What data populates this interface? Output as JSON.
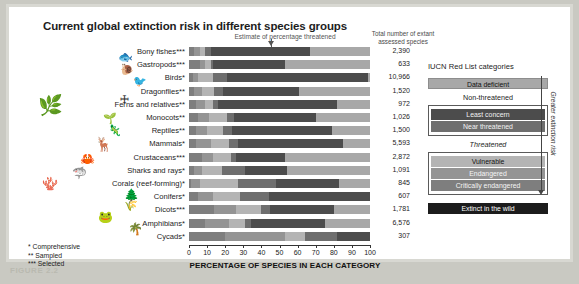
{
  "figure": {
    "caption": "FIGURE 2.2",
    "title": "Current global extinction risk in different species groups",
    "estimate_annotation": "Estimate of percentage threatened",
    "total_header_line1": "Total number of extant",
    "total_header_line2": "assessed species"
  },
  "axis": {
    "title": "PERCENTAGE OF SPECIES IN EACH CATEGORY",
    "ticks": [
      0,
      10,
      20,
      30,
      40,
      50,
      60,
      70,
      80,
      90,
      100
    ],
    "min": 0,
    "max": 100
  },
  "footnotes": [
    "* Comprehensive",
    "** Sampled",
    "*** Selected"
  ],
  "legend": {
    "title": "IUCN Red List categories",
    "data_deficient": "Data deficient",
    "non_threatened_header": "Non-threatened",
    "least_concern": "Least concern",
    "near_threatened": "Near threatened",
    "threatened_header": "Threatened",
    "vulnerable": "Vulnerable",
    "endangered": "Endangered",
    "critically_endangered": "Critically endangered",
    "extinct_in_the_wild": "Extinct in the wild",
    "risk_axis_label": "Greater extinction risk"
  },
  "colors": {
    "data_deficient": "#a8a8a8",
    "least_concern": "#4c4c4c",
    "near_threatened": "#6e6e6e",
    "vulnerable": "#b4b4b4",
    "endangered": "#949494",
    "critically_endangered": "#7e7e7e",
    "extinct_in_the_wild": "#1c1c1c",
    "frame": "#d8d8d2",
    "page": "#c9c9c2"
  },
  "chart_data": {
    "type": "bar",
    "orientation": "horizontal",
    "stacked": true,
    "title": "Current global extinction risk in different species groups",
    "xlabel": "PERCENTAGE OF SPECIES IN EACH CATEGORY",
    "ylabel": "",
    "xlim": [
      0,
      100
    ],
    "grid": true,
    "legend_position": "right",
    "series_order": [
      "critically_endangered",
      "endangered",
      "vulnerable",
      "near_threatened",
      "least_concern",
      "data_deficient",
      "extinct_in_the_wild"
    ],
    "categories": [
      "Bony fishes***",
      "Gastropods***",
      "Birds*",
      "Dragonflies**",
      "Ferns and relatives**",
      "Monocots**",
      "Reptiles**",
      "Mammals*",
      "Crustaceans***",
      "Sharks and rays*",
      "Corals (reef-forming)*",
      "Conifers*",
      "Dicots***",
      "Amphibians*",
      "Cycads*"
    ],
    "totals": [
      "2,390",
      "633",
      "10,966",
      "1,520",
      "972",
      "1,026",
      "1,500",
      "5,593",
      "2,872",
      "1,091",
      "845",
      "607",
      "1,781",
      "6,576",
      "307"
    ],
    "rows": [
      {
        "category": "Bony fishes***",
        "segments": [
          3,
          3,
          3,
          3,
          55,
          33,
          0
        ]
      },
      {
        "category": "Gastropods***",
        "segments": [
          6,
          3,
          3,
          1,
          40,
          47,
          0
        ]
      },
      {
        "category": "Birds*",
        "segments": [
          2,
          3,
          8,
          8,
          78,
          1,
          0
        ]
      },
      {
        "category": "Dragonflies**",
        "segments": [
          3,
          4,
          7,
          5,
          42,
          39,
          0
        ]
      },
      {
        "category": "Ferns and relatives**",
        "segments": [
          4,
          5,
          4,
          3,
          66,
          18,
          0
        ]
      },
      {
        "category": "Monocots**",
        "segments": [
          5,
          6,
          10,
          4,
          45,
          30,
          0
        ]
      },
      {
        "category": "Reptiles**",
        "segments": [
          4,
          6,
          9,
          5,
          55,
          21,
          0
        ]
      },
      {
        "category": "Mammals*",
        "segments": [
          4,
          8,
          10,
          5,
          58,
          15,
          0
        ]
      },
      {
        "category": "Crustaceans***",
        "segments": [
          7,
          6,
          10,
          3,
          27,
          47,
          0
        ]
      },
      {
        "category": "Sharks and rays*",
        "segments": [
          3,
          4,
          11,
          13,
          23,
          46,
          0
        ]
      },
      {
        "category": "Corals (reef-forming)*",
        "segments": [
          1,
          5,
          21,
          21,
          35,
          17,
          0
        ]
      },
      {
        "category": "Conifers*",
        "segments": [
          5,
          8,
          15,
          16,
          56,
          0,
          0
        ]
      },
      {
        "category": "Dicots***",
        "segments": [
          14,
          12,
          14,
          5,
          35,
          20,
          0
        ]
      },
      {
        "category": "Amphibians*",
        "segments": [
          9,
          13,
          9,
          3,
          41,
          25,
          0
        ]
      },
      {
        "category": "Cycads*",
        "segments": [
          20,
          33,
          11,
          18,
          18,
          0,
          0
        ]
      }
    ]
  }
}
